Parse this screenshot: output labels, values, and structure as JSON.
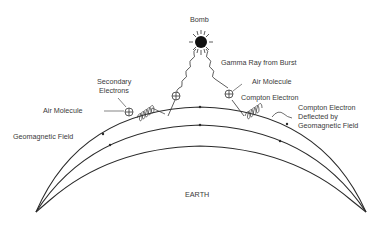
{
  "diagram": {
    "labels": {
      "bomb": "Bomb",
      "gamma_ray": "Gamma Ray from Burst",
      "air_molecule_right": "Air Molecule",
      "compton_electron": "Compton Electron",
      "compton_deflected_1": "Compton Electron",
      "compton_deflected_2": "Deflected by",
      "compton_deflected_3": "Geomagnetic Field",
      "secondary_1": "Secondary",
      "secondary_2": "Electrons",
      "air_molecule_left": "Air Molecule",
      "geomagnetic_field": "Geomagnetic Field",
      "earth": "EARTH"
    },
    "colors": {
      "line": "#2a2a2a",
      "text": "#3a3a3a",
      "background": "#ffffff"
    }
  }
}
